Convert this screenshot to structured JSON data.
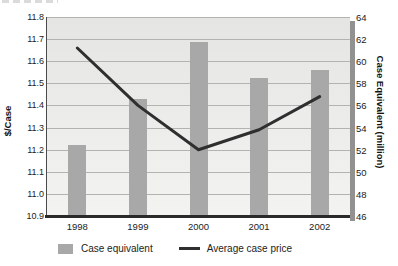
{
  "chart_data": {
    "type": "combo",
    "categories": [
      "1998",
      "1999",
      "2000",
      "2001",
      "2002"
    ],
    "series": [
      {
        "name": "Case equivalent",
        "type": "bar",
        "axis": "right",
        "color": "#a8a8a8",
        "values": [
          52.4,
          56.6,
          61.7,
          58.5,
          59.2
        ]
      },
      {
        "name": "Average case price",
        "type": "line",
        "axis": "left",
        "color": "#2f2f2f",
        "values": [
          11.66,
          11.4,
          11.2,
          11.29,
          11.44
        ]
      }
    ],
    "left_axis": {
      "label": "$/Case",
      "min": 10.9,
      "max": 11.8,
      "step": 0.1,
      "ticks": [
        "11.8",
        "11.7",
        "11.6",
        "11.5",
        "11.4",
        "11.3",
        "11.2",
        "11.1",
        "11.0",
        "10.9"
      ]
    },
    "right_axis": {
      "label": "Case Equivalent (million)",
      "min": 46,
      "max": 64,
      "step": 2,
      "ticks": [
        "64",
        "62",
        "60",
        "58",
        "56",
        "54",
        "52",
        "50",
        "48",
        "46"
      ]
    },
    "legend": {
      "position": "bottom",
      "items": [
        {
          "label": "Case equivalent",
          "swatch": "bar"
        },
        {
          "label": "Average case price",
          "swatch": "line"
        }
      ]
    },
    "grid": true,
    "colors": {
      "plot_bg_top": "#e5e5e3",
      "plot_bg_bottom": "#f3f3f1",
      "gridline": "#b3b3b1",
      "axis_line": "#2a2a2a",
      "bar": "#a8a8a8",
      "line": "#2f2f2f",
      "shadow": "#919191"
    }
  }
}
